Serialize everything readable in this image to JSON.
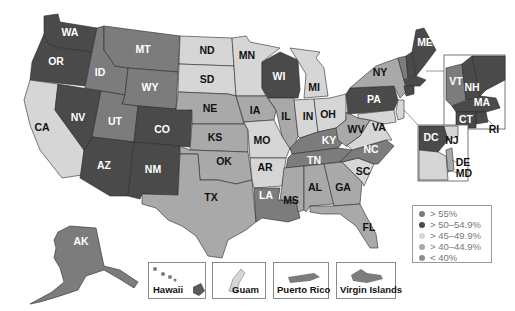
{
  "map": {
    "type": "choropleth",
    "region": "United States",
    "colors": {
      "gt55": "#7c7c7c",
      "50to54_9": "#4a4a4a",
      "45to49_9": "#d6d6d6",
      "40to44_9": "#a9a9a9",
      "lt40": "#8e8e8e"
    },
    "legend": [
      {
        "label": "> 55%",
        "color": "#7c7c7c"
      },
      {
        "label": "> 50–54.9%",
        "color": "#4a4a4a"
      },
      {
        "label": "> 45–49.9%",
        "color": "#d6d6d6"
      },
      {
        "label": "> 40–44.9%",
        "color": "#a9a9a9"
      },
      {
        "label": "< 40%",
        "color": "#8e8e8e"
      }
    ],
    "states": {
      "WA": {
        "label": "WA",
        "category": "50to54_9"
      },
      "OR": {
        "label": "OR",
        "category": "50to54_9"
      },
      "CA": {
        "label": "CA",
        "category": "45to49_9"
      },
      "NV": {
        "label": "NV",
        "category": "50to54_9"
      },
      "ID": {
        "label": "ID",
        "category": "gt55"
      },
      "MT": {
        "label": "MT",
        "category": "gt55"
      },
      "WY": {
        "label": "WY",
        "category": "gt55"
      },
      "UT": {
        "label": "UT",
        "category": "gt55"
      },
      "AZ": {
        "label": "AZ",
        "category": "50to54_9"
      },
      "CO": {
        "label": "CO",
        "category": "50to54_9"
      },
      "NM": {
        "label": "NM",
        "category": "50to54_9"
      },
      "ND": {
        "label": "ND",
        "category": "45to49_9"
      },
      "SD": {
        "label": "SD",
        "category": "45to49_9"
      },
      "NE": {
        "label": "NE",
        "category": "40to44_9"
      },
      "KS": {
        "label": "KS",
        "category": "40to44_9"
      },
      "OK": {
        "label": "OK",
        "category": "40to44_9"
      },
      "TX": {
        "label": "TX",
        "category": "40to44_9"
      },
      "MN": {
        "label": "MN",
        "category": "45to49_9"
      },
      "IA": {
        "label": "IA",
        "category": "40to44_9"
      },
      "MO": {
        "label": "MO",
        "category": "45to49_9"
      },
      "AR": {
        "label": "AR",
        "category": "45to49_9"
      },
      "LA": {
        "label": "LA",
        "category": "gt55"
      },
      "WI": {
        "label": "WI",
        "category": "50to54_9"
      },
      "IL": {
        "label": "IL",
        "category": "40to44_9"
      },
      "MI": {
        "label": "MI",
        "category": "45to49_9"
      },
      "IN": {
        "label": "IN",
        "category": "45to49_9"
      },
      "OH": {
        "label": "OH",
        "category": "45to49_9"
      },
      "KY": {
        "label": "KY",
        "category": "gt55"
      },
      "TN": {
        "label": "TN",
        "category": "gt55"
      },
      "MS": {
        "label": "MS",
        "category": "40to44_9"
      },
      "AL": {
        "label": "AL",
        "category": "40to44_9"
      },
      "GA": {
        "label": "GA",
        "category": "40to44_9"
      },
      "FL": {
        "label": "FL",
        "category": "40to44_9"
      },
      "SC": {
        "label": "SC",
        "category": "45to49_9"
      },
      "NC": {
        "label": "NC",
        "category": "gt55"
      },
      "VA": {
        "label": "VA",
        "category": "45to49_9"
      },
      "WV": {
        "label": "WV",
        "category": "40to44_9"
      },
      "PA": {
        "label": "PA",
        "category": "50to54_9"
      },
      "NY": {
        "label": "NY",
        "category": "40to44_9"
      },
      "ME": {
        "label": "ME",
        "category": "50to54_9"
      },
      "VT": {
        "label": "VT",
        "category": "gt55"
      },
      "NH": {
        "label": "NH",
        "category": "50to54_9"
      },
      "MA": {
        "label": "MA",
        "category": "50to54_9"
      },
      "CT": {
        "label": "CT",
        "category": "50to54_9"
      },
      "RI": {
        "label": "RI",
        "category": "50to54_9"
      },
      "NJ": {
        "label": "NJ",
        "category": "45to49_9"
      },
      "DE": {
        "label": "DE",
        "category": "40to44_9"
      },
      "MD": {
        "label": "MD",
        "category": "45to49_9"
      },
      "DC": {
        "label": "DC",
        "category": "50to54_9"
      },
      "AK": {
        "label": "AK",
        "category": "gt55"
      }
    },
    "territories": [
      {
        "label": "Hawaii"
      },
      {
        "label": "Guam"
      },
      {
        "label": "Puerto Rico"
      },
      {
        "label": "Virgin Islands"
      }
    ]
  }
}
